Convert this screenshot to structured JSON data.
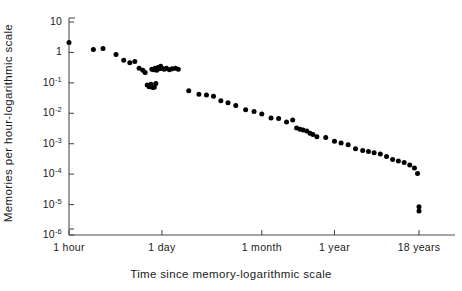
{
  "chart_data": {
    "type": "scatter",
    "title": "",
    "xlabel": "Time since memory-logarithmic scale",
    "ylabel": "Memories per hour-logarithmic scale",
    "grid": false,
    "legend": null,
    "x_scale": "log",
    "y_scale": "log",
    "x_tick_labels": [
      "1 hour",
      "1 day",
      "1 month",
      "1 year",
      "18 years"
    ],
    "x_tick_hours": [
      1,
      24,
      730,
      8766,
      157788
    ],
    "y_tick_labels": [
      "10",
      "1",
      "10-1",
      "10-2",
      "10-3",
      "10-4",
      "10-5",
      "10-6"
    ],
    "y_tick_values": [
      10,
      1,
      0.1,
      0.01,
      0.001,
      0.0001,
      1e-05,
      1e-06
    ],
    "ylim": [
      1e-06,
      10
    ],
    "xlim_hours": [
      1,
      400000
    ],
    "marker": "filled-circle",
    "marker_color": "#000000",
    "marker_size_px": 5,
    "points": [
      {
        "x": 1.0,
        "y": 2.1
      },
      {
        "x": 2.3,
        "y": 1.25
      },
      {
        "x": 3.2,
        "y": 1.35
      },
      {
        "x": 5.0,
        "y": 0.85
      },
      {
        "x": 6.5,
        "y": 0.55
      },
      {
        "x": 8.0,
        "y": 0.46
      },
      {
        "x": 9.5,
        "y": 0.5
      },
      {
        "x": 11.0,
        "y": 0.3
      },
      {
        "x": 12.5,
        "y": 0.26
      },
      {
        "x": 13.5,
        "y": 0.22
      },
      {
        "x": 14.5,
        "y": 0.085
      },
      {
        "x": 15.5,
        "y": 0.075
      },
      {
        "x": 16.5,
        "y": 0.09
      },
      {
        "x": 17.5,
        "y": 0.07
      },
      {
        "x": 18.5,
        "y": 0.072
      },
      {
        "x": 19.5,
        "y": 0.095
      },
      {
        "x": 17.0,
        "y": 0.28
      },
      {
        "x": 18.0,
        "y": 0.27
      },
      {
        "x": 19.0,
        "y": 0.3
      },
      {
        "x": 20.0,
        "y": 0.26
      },
      {
        "x": 21.0,
        "y": 0.32
      },
      {
        "x": 22.0,
        "y": 0.29
      },
      {
        "x": 23.0,
        "y": 0.35
      },
      {
        "x": 24.0,
        "y": 0.3
      },
      {
        "x": 26.0,
        "y": 0.28
      },
      {
        "x": 28.0,
        "y": 0.3
      },
      {
        "x": 31.0,
        "y": 0.27
      },
      {
        "x": 34.0,
        "y": 0.29
      },
      {
        "x": 38.0,
        "y": 0.3
      },
      {
        "x": 42.0,
        "y": 0.28
      },
      {
        "x": 60.0,
        "y": 0.055
      },
      {
        "x": 85.0,
        "y": 0.042
      },
      {
        "x": 110.0,
        "y": 0.04
      },
      {
        "x": 140.0,
        "y": 0.036
      },
      {
        "x": 180.0,
        "y": 0.026
      },
      {
        "x": 230.0,
        "y": 0.022
      },
      {
        "x": 300.0,
        "y": 0.018
      },
      {
        "x": 420.0,
        "y": 0.013
      },
      {
        "x": 560.0,
        "y": 0.0115
      },
      {
        "x": 730.0,
        "y": 0.0095
      },
      {
        "x": 1000.0,
        "y": 0.007
      },
      {
        "x": 1300.0,
        "y": 0.0068
      },
      {
        "x": 1700.0,
        "y": 0.0052
      },
      {
        "x": 2100.0,
        "y": 0.006
      },
      {
        "x": 2400.0,
        "y": 0.0033
      },
      {
        "x": 2700.0,
        "y": 0.003
      },
      {
        "x": 3000.0,
        "y": 0.0028
      },
      {
        "x": 3400.0,
        "y": 0.0026
      },
      {
        "x": 3800.0,
        "y": 0.0022
      },
      {
        "x": 4200.0,
        "y": 0.002
      },
      {
        "x": 4800.0,
        "y": 0.0017
      },
      {
        "x": 6500.0,
        "y": 0.0016
      },
      {
        "x": 8766.0,
        "y": 0.0012
      },
      {
        "x": 11000.0,
        "y": 0.00105
      },
      {
        "x": 14000.0,
        "y": 0.00092
      },
      {
        "x": 18000.0,
        "y": 0.00068
      },
      {
        "x": 23000.0,
        "y": 0.0006
      },
      {
        "x": 28000.0,
        "y": 0.00055
      },
      {
        "x": 34000.0,
        "y": 0.0005
      },
      {
        "x": 42000.0,
        "y": 0.00046
      },
      {
        "x": 52000.0,
        "y": 0.00038
      },
      {
        "x": 64000.0,
        "y": 0.0003
      },
      {
        "x": 78000.0,
        "y": 0.00027
      },
      {
        "x": 95000.0,
        "y": 0.00024
      },
      {
        "x": 115000.0,
        "y": 0.0002
      },
      {
        "x": 135000.0,
        "y": 0.00016
      },
      {
        "x": 150000.0,
        "y": 0.000105
      },
      {
        "x": 157788.0,
        "y": 8.5e-06
      },
      {
        "x": 157788.0,
        "y": 6.2e-06
      }
    ]
  },
  "axes": {
    "y_title": "Memories per hour-logarithmic scale",
    "x_title": "Time since memory-logarithmic scale",
    "y_labels": [
      {
        "mantissa": "10",
        "exp": ""
      },
      {
        "mantissa": "1",
        "exp": ""
      },
      {
        "mantissa": "10",
        "exp": "-1"
      },
      {
        "mantissa": "10",
        "exp": "-2"
      },
      {
        "mantissa": "10",
        "exp": "-3"
      },
      {
        "mantissa": "10",
        "exp": "-4"
      },
      {
        "mantissa": "10",
        "exp": "-5"
      },
      {
        "mantissa": "10",
        "exp": "-6"
      }
    ],
    "x_labels": [
      "1 hour",
      "1 day",
      "1 month",
      "1 year",
      "18 years"
    ]
  },
  "colors": {
    "axis": "#4d4d4d",
    "marker": "#111111",
    "text": "#1a1a1a",
    "background": "#ffffff"
  }
}
